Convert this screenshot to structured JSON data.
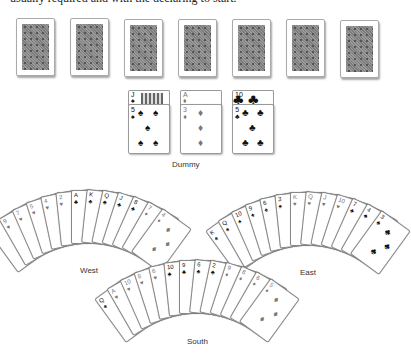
{
  "caption_text": "usually required and with the declaring to start.",
  "top_backs": {
    "count": 7,
    "x": [
      16,
      70,
      124,
      178,
      232,
      286,
      340
    ],
    "y": [
      18,
      18,
      19,
      19,
      19,
      19,
      20
    ]
  },
  "dummy": {
    "label": "Dummy",
    "columns": [
      {
        "top": {
          "rank": "J",
          "suit": "♠"
        },
        "bottom": {
          "rank": "5",
          "suit": "♠"
        }
      },
      {
        "top": {
          "rank": "A",
          "suit": "♦"
        },
        "bottom": {
          "rank": "3",
          "suit": "♦"
        }
      },
      {
        "top": {
          "rank": "10",
          "suit": "♣"
        },
        "bottom": {
          "rank": "5",
          "suit": "♣"
        }
      }
    ]
  },
  "hands": {
    "west": {
      "label": "West",
      "cards": [
        {
          "rank": "4",
          "suit": "♠"
        },
        {
          "rank": "9",
          "suit": "♥"
        },
        {
          "rank": "7",
          "suit": "♥"
        },
        {
          "rank": "5",
          "suit": "♥"
        },
        {
          "rank": "4",
          "suit": "♥"
        },
        {
          "rank": "2",
          "suit": "♥"
        },
        {
          "rank": "A",
          "suit": "♣"
        },
        {
          "rank": "K",
          "suit": "♣"
        },
        {
          "rank": "Q",
          "suit": "♣"
        },
        {
          "rank": "J",
          "suit": "♣"
        },
        {
          "rank": "8",
          "suit": "♣"
        },
        {
          "rank": "7",
          "suit": "♦"
        },
        {
          "rank": "4",
          "suit": "♦"
        }
      ]
    },
    "east": {
      "label": "East",
      "cards": [
        {
          "rank": "K",
          "suit": "♠"
        },
        {
          "rank": "Q",
          "suit": "♠"
        },
        {
          "rank": "10",
          "suit": "♠"
        },
        {
          "rank": "9",
          "suit": "♠"
        },
        {
          "rank": "6",
          "suit": "♠"
        },
        {
          "rank": "3",
          "suit": "♠"
        },
        {
          "rank": "K",
          "suit": "♥"
        },
        {
          "rank": "Q",
          "suit": "♥"
        },
        {
          "rank": "J",
          "suit": "♥"
        },
        {
          "rank": "10",
          "suit": "♥"
        },
        {
          "rank": "7",
          "suit": "♣"
        },
        {
          "rank": "4",
          "suit": "♣"
        },
        {
          "rank": "3",
          "suit": "♣"
        }
      ]
    },
    "south": {
      "label": "South",
      "cards": [
        {
          "rank": "Q",
          "suit": "♠"
        },
        {
          "rank": "A",
          "suit": "♥"
        },
        {
          "rank": "10",
          "suit": "♥"
        },
        {
          "rank": "8",
          "suit": "♥"
        },
        {
          "rank": "6",
          "suit": "♥"
        },
        {
          "rank": "10",
          "suit": "♣"
        },
        {
          "rank": "9",
          "suit": "♣"
        },
        {
          "rank": "6",
          "suit": "♣"
        },
        {
          "rank": "2",
          "suit": "♣"
        },
        {
          "rank": "9",
          "suit": "♦"
        },
        {
          "rank": "8",
          "suit": "♦"
        },
        {
          "rank": "6",
          "suit": "♦"
        },
        {
          "rank": "5",
          "suit": "♦"
        }
      ]
    }
  },
  "colors": {
    "red_suit": "#777777",
    "black_suit": "#111111",
    "card_back": "#8a8a8a"
  }
}
